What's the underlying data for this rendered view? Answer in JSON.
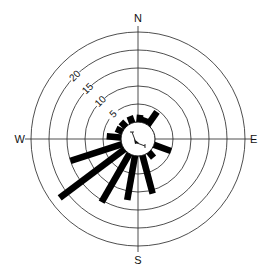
{
  "chart_data": {
    "type": "rose",
    "title": "",
    "center": [
      138,
      139
    ],
    "inner_radius_px": 17,
    "px_per_unit": 3.6,
    "rings": [
      5,
      10,
      15,
      20,
      25
    ],
    "ring_labels": [
      "5",
      "10",
      "15",
      "20"
    ],
    "compass": {
      "N": "N",
      "E": "E",
      "S": "S",
      "W": "W"
    },
    "bar_width_deg": 10,
    "bars": [
      {
        "direction": 5,
        "value": 2
      },
      {
        "direction": 20,
        "value": 1.5
      },
      {
        "direction": 35,
        "value": 4.5
      },
      {
        "direction": 110,
        "value": 5
      },
      {
        "direction": 140,
        "value": 2
      },
      {
        "direction": 165,
        "value": 11
      },
      {
        "direction": 190,
        "value": 12.5
      },
      {
        "direction": 210,
        "value": 15.5
      },
      {
        "direction": 233,
        "value": 22.5
      },
      {
        "direction": 252,
        "value": 15
      },
      {
        "direction": 275,
        "value": 4
      },
      {
        "direction": 295,
        "value": 2
      },
      {
        "direction": 315,
        "value": 2
      },
      {
        "direction": 340,
        "value": 2
      }
    ]
  }
}
